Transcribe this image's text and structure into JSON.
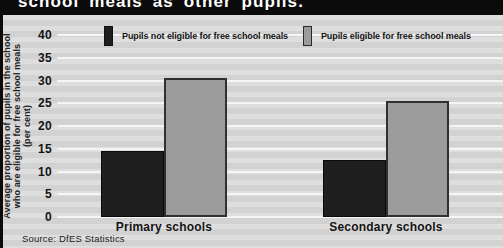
{
  "window": {
    "width": 503,
    "height": 248
  },
  "title_band": {
    "text": "school meals as other pupils."
  },
  "legend": {
    "items": [
      {
        "label": "Pupils not eligible for free school meals",
        "color": "#1f1f1f"
      },
      {
        "label": "Pupils eligible for free school meals",
        "color": "#9c9c9c"
      }
    ]
  },
  "y_axis": {
    "label_lines": [
      "Average proportion of pupils in the school",
      "who are eligible for free school meals",
      "(per cent)"
    ],
    "ticks": [
      0,
      5,
      10,
      15,
      20,
      25,
      30,
      35,
      40
    ]
  },
  "source": "Source: DfES Statistics",
  "chart_data": {
    "type": "bar",
    "title": "school meals as other pupils.",
    "categories": [
      "Primary schools",
      "Secondary schools"
    ],
    "series": [
      {
        "name": "Pupils not eligible for free school meals",
        "color": "#1f1f1f",
        "values": [
          14.5,
          12.5
        ]
      },
      {
        "name": "Pupils eligible for free school meals",
        "color": "#9c9c9c",
        "values": [
          30.5,
          25.5
        ]
      }
    ],
    "xlabel": "",
    "ylabel": "Average proportion of pupils in the school who are eligible for free school meals (per cent)",
    "ylim": [
      0,
      40
    ],
    "ytick_step": 5,
    "grid": true,
    "gridline_color": "#f5f5f5",
    "background_color": "#d6d6d6",
    "band_color": "#0b0b0b",
    "legend_position": "top",
    "source": "Source: DfES Statistics"
  }
}
